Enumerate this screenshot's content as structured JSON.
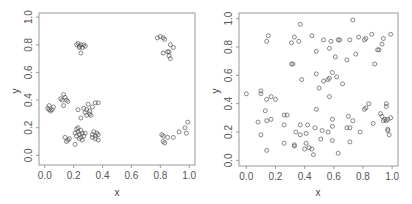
{
  "chart_data": [
    {
      "type": "scatter",
      "title": "",
      "xlabel": "x",
      "ylabel": "y",
      "xlim": [
        -0.04,
        1.04
      ],
      "ylim": [
        -0.07,
        1.03
      ],
      "xticks": [
        "0.0",
        "0.2",
        "0.4",
        "0.6",
        "0.8",
        "1.0"
      ],
      "yticks": [
        "0.0",
        "0.2",
        "0.4",
        "0.6",
        "0.8",
        "1.0"
      ],
      "grid": false,
      "legend": null,
      "marker": "open-circle",
      "description": "Clustered point pattern",
      "points": [
        [
          0.02,
          0.34
        ],
        [
          0.03,
          0.36
        ],
        [
          0.04,
          0.32
        ],
        [
          0.05,
          0.33
        ],
        [
          0.03,
          0.33
        ],
        [
          0.06,
          0.35
        ],
        [
          0.11,
          0.41
        ],
        [
          0.13,
          0.44
        ],
        [
          0.14,
          0.42
        ],
        [
          0.15,
          0.4
        ],
        [
          0.16,
          0.39
        ],
        [
          0.13,
          0.36
        ],
        [
          0.12,
          0.4
        ],
        [
          0.22,
          0.8
        ],
        [
          0.23,
          0.81
        ],
        [
          0.24,
          0.79
        ],
        [
          0.25,
          0.8
        ],
        [
          0.26,
          0.78
        ],
        [
          0.27,
          0.8
        ],
        [
          0.28,
          0.79
        ],
        [
          0.25,
          0.74
        ],
        [
          0.24,
          0.78
        ],
        [
          0.23,
          0.33
        ],
        [
          0.25,
          0.27
        ],
        [
          0.27,
          0.34
        ],
        [
          0.28,
          0.31
        ],
        [
          0.29,
          0.33
        ],
        [
          0.3,
          0.37
        ],
        [
          0.31,
          0.32
        ],
        [
          0.32,
          0.29
        ],
        [
          0.33,
          0.35
        ],
        [
          0.35,
          0.38
        ],
        [
          0.37,
          0.38
        ],
        [
          0.29,
          0.29
        ],
        [
          0.31,
          0.3
        ],
        [
          0.21,
          0.16
        ],
        [
          0.22,
          0.19
        ],
        [
          0.23,
          0.17
        ],
        [
          0.24,
          0.15
        ],
        [
          0.25,
          0.18
        ],
        [
          0.26,
          0.16
        ],
        [
          0.27,
          0.14
        ],
        [
          0.24,
          0.12
        ],
        [
          0.22,
          0.14
        ],
        [
          0.23,
          0.2
        ],
        [
          0.25,
          0.13
        ],
        [
          0.28,
          0.16
        ],
        [
          0.26,
          0.11
        ],
        [
          0.21,
          0.08
        ],
        [
          0.14,
          0.13
        ],
        [
          0.16,
          0.11
        ],
        [
          0.17,
          0.12
        ],
        [
          0.15,
          0.1
        ],
        [
          0.33,
          0.15
        ],
        [
          0.34,
          0.17
        ],
        [
          0.35,
          0.14
        ],
        [
          0.36,
          0.16
        ],
        [
          0.37,
          0.15
        ],
        [
          0.35,
          0.12
        ],
        [
          0.37,
          0.11
        ],
        [
          0.33,
          0.13
        ],
        [
          0.78,
          0.85
        ],
        [
          0.8,
          0.86
        ],
        [
          0.82,
          0.85
        ],
        [
          0.83,
          0.84
        ],
        [
          0.82,
          0.74
        ],
        [
          0.85,
          0.75
        ],
        [
          0.86,
          0.75
        ],
        [
          0.87,
          0.8
        ],
        [
          0.86,
          0.72
        ],
        [
          0.87,
          0.7
        ],
        [
          0.89,
          0.78
        ],
        [
          0.81,
          0.15
        ],
        [
          0.82,
          0.14
        ],
        [
          0.82,
          0.1
        ],
        [
          0.83,
          0.09
        ],
        [
          0.85,
          0.13
        ],
        [
          0.89,
          0.13
        ],
        [
          0.93,
          0.17
        ],
        [
          0.97,
          0.2
        ],
        [
          0.98,
          0.16
        ],
        [
          0.99,
          0.24
        ]
      ]
    },
    {
      "type": "scatter",
      "title": "",
      "xlabel": "x",
      "ylabel": "y",
      "xlim": [
        -0.05,
        1.04
      ],
      "ylim": [
        -0.04,
        1.04
      ],
      "xticks": [
        "0.0",
        "0.2",
        "0.4",
        "0.6",
        "0.8",
        "1.0"
      ],
      "yticks": [
        "0.0",
        "0.2",
        "0.4",
        "0.6",
        "0.8",
        "1.0"
      ],
      "grid": false,
      "legend": null,
      "marker": "open-circle",
      "description": "Random (uniform) point pattern",
      "points": [
        [
          0.0,
          0.47
        ],
        [
          0.1,
          0.49
        ],
        [
          0.1,
          0.47
        ],
        [
          0.14,
          0.43
        ],
        [
          0.17,
          0.45
        ],
        [
          0.2,
          0.43
        ],
        [
          0.13,
          0.35
        ],
        [
          0.14,
          0.28
        ],
        [
          0.17,
          0.29
        ],
        [
          0.08,
          0.27
        ],
        [
          0.1,
          0.18
        ],
        [
          0.14,
          0.07
        ],
        [
          0.14,
          0.84
        ],
        [
          0.15,
          0.88
        ],
        [
          0.31,
          0.83
        ],
        [
          0.33,
          0.87
        ],
        [
          0.36,
          0.84
        ],
        [
          0.37,
          0.96
        ],
        [
          0.45,
          0.88
        ],
        [
          0.48,
          0.77
        ],
        [
          0.53,
          0.85
        ],
        [
          0.58,
          0.84
        ],
        [
          0.57,
          0.79
        ],
        [
          0.61,
          0.73
        ],
        [
          0.64,
          0.85
        ],
        [
          0.63,
          0.85
        ],
        [
          0.32,
          0.68
        ],
        [
          0.31,
          0.68
        ],
        [
          0.38,
          0.57
        ],
        [
          0.48,
          0.61
        ],
        [
          0.5,
          0.51
        ],
        [
          0.53,
          0.56
        ],
        [
          0.56,
          0.57
        ],
        [
          0.57,
          0.58
        ],
        [
          0.59,
          0.62
        ],
        [
          0.62,
          0.59
        ],
        [
          0.66,
          0.54
        ],
        [
          0.57,
          0.45
        ],
        [
          0.26,
          0.32
        ],
        [
          0.28,
          0.32
        ],
        [
          0.26,
          0.25
        ],
        [
          0.26,
          0.12
        ],
        [
          0.34,
          0.2
        ],
        [
          0.37,
          0.18
        ],
        [
          0.37,
          0.25
        ],
        [
          0.42,
          0.25
        ],
        [
          0.41,
          0.19
        ],
        [
          0.47,
          0.23
        ],
        [
          0.48,
          0.36
        ],
        [
          0.33,
          0.1
        ],
        [
          0.33,
          0.11
        ],
        [
          0.41,
          0.12
        ],
        [
          0.4,
          0.08
        ],
        [
          0.43,
          0.09
        ],
        [
          0.45,
          0.08
        ],
        [
          0.46,
          0.04
        ],
        [
          0.51,
          0.15
        ],
        [
          0.52,
          0.21
        ],
        [
          0.56,
          0.2
        ],
        [
          0.59,
          0.24
        ],
        [
          0.59,
          0.29
        ],
        [
          0.59,
          0.14
        ],
        [
          0.63,
          0.05
        ],
        [
          0.69,
          0.71
        ],
        [
          0.71,
          0.85
        ],
        [
          0.73,
          0.99
        ],
        [
          0.75,
          0.75
        ],
        [
          0.77,
          0.87
        ],
        [
          0.81,
          0.85
        ],
        [
          0.82,
          0.86
        ],
        [
          0.86,
          0.89
        ],
        [
          0.88,
          0.68
        ],
        [
          0.9,
          0.78
        ],
        [
          0.91,
          0.78
        ],
        [
          0.93,
          0.82
        ],
        [
          0.94,
          0.86
        ],
        [
          0.99,
          0.89
        ],
        [
          0.7,
          0.31
        ],
        [
          0.73,
          0.28
        ],
        [
          0.69,
          0.23
        ],
        [
          0.71,
          0.23
        ],
        [
          0.71,
          0.13
        ],
        [
          0.78,
          0.2
        ],
        [
          0.81,
          0.36
        ],
        [
          0.82,
          0.37
        ],
        [
          0.84,
          0.4
        ],
        [
          0.87,
          0.26
        ],
        [
          0.92,
          0.33
        ],
        [
          0.93,
          0.31
        ],
        [
          0.94,
          0.28
        ],
        [
          0.95,
          0.29
        ],
        [
          0.96,
          0.28
        ],
        [
          0.97,
          0.29
        ],
        [
          0.99,
          0.3
        ],
        [
          0.96,
          0.38
        ],
        [
          0.96,
          0.4
        ],
        [
          0.97,
          0.22
        ],
        [
          0.97,
          0.21
        ],
        [
          0.98,
          0.18
        ]
      ]
    }
  ],
  "panels": [
    {
      "xlabel": "x",
      "ylabel": "y",
      "xticks": [
        "0.0",
        "0.2",
        "0.4",
        "0.6",
        "0.8",
        "1.0"
      ],
      "yticks": [
        "0.0",
        "0.2",
        "0.4",
        "0.6",
        "0.8",
        "1.0"
      ]
    },
    {
      "xlabel": "x",
      "ylabel": "y",
      "xticks": [
        "0.0",
        "0.2",
        "0.4",
        "0.6",
        "0.8",
        "1.0"
      ],
      "yticks": [
        "0.0",
        "0.2",
        "0.4",
        "0.6",
        "0.8",
        "1.0"
      ]
    }
  ],
  "colors": {
    "axis": "#999999",
    "marker": "#555555",
    "text": "#555555"
  }
}
